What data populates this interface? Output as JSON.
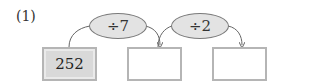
{
  "problem": {
    "label": "(1)",
    "operations": [
      {
        "text": "÷7"
      },
      {
        "text": "÷2"
      }
    ],
    "boxes": [
      {
        "value": "252"
      },
      {
        "value": ""
      },
      {
        "value": ""
      }
    ]
  }
}
